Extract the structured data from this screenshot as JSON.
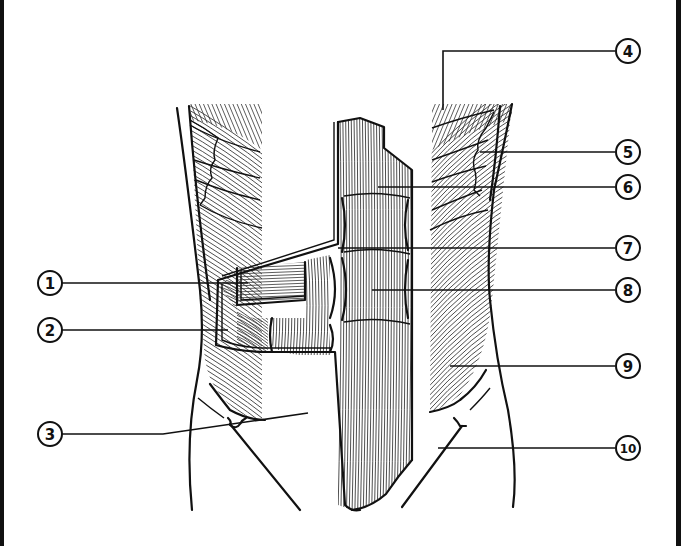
{
  "figure": {
    "type": "anatomical-diagram",
    "colors": {
      "ink": "#111111",
      "background": "#ffffff",
      "border": "#111111"
    }
  },
  "callouts": [
    {
      "id": 1,
      "label": "1",
      "side": "left",
      "cx": 50,
      "cy": 283,
      "leader": [
        [
          62,
          283
        ],
        [
          248,
          283
        ]
      ]
    },
    {
      "id": 2,
      "label": "2",
      "side": "left",
      "cx": 50,
      "cy": 330,
      "leader": [
        [
          62,
          330
        ],
        [
          228,
          330
        ]
      ]
    },
    {
      "id": 3,
      "label": "3",
      "side": "left",
      "cx": 50,
      "cy": 434,
      "leader": [
        [
          62,
          434
        ],
        [
          163,
          434
        ],
        [
          308,
          413
        ]
      ]
    },
    {
      "id": 4,
      "label": "4",
      "side": "right",
      "cx": 628,
      "cy": 51,
      "leader": [
        [
          615,
          51
        ],
        [
          443,
          51
        ],
        [
          443,
          110
        ]
      ]
    },
    {
      "id": 5,
      "label": "5",
      "side": "right",
      "cx": 628,
      "cy": 152,
      "leader": [
        [
          615,
          152
        ],
        [
          480,
          152
        ]
      ]
    },
    {
      "id": 6,
      "label": "6",
      "side": "right",
      "cx": 628,
      "cy": 187,
      "leader": [
        [
          615,
          187
        ],
        [
          378,
          187
        ]
      ]
    },
    {
      "id": 7,
      "label": "7",
      "side": "right",
      "cx": 628,
      "cy": 248,
      "leader": [
        [
          615,
          248
        ],
        [
          338,
          248
        ]
      ]
    },
    {
      "id": 8,
      "label": "8",
      "side": "right",
      "cx": 628,
      "cy": 290,
      "leader": [
        [
          615,
          290
        ],
        [
          372,
          290
        ]
      ]
    },
    {
      "id": 9,
      "label": "9",
      "side": "right",
      "cx": 628,
      "cy": 366,
      "leader": [
        [
          615,
          366
        ],
        [
          450,
          366
        ]
      ]
    },
    {
      "id": 10,
      "label": "10",
      "side": "right",
      "cx": 628,
      "cy": 448,
      "leader": [
        [
          615,
          448
        ],
        [
          438,
          448
        ]
      ]
    }
  ]
}
